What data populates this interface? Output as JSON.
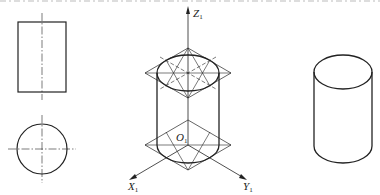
{
  "figure": {
    "top_caption_cutoff": "",
    "views": {
      "front_view": {
        "name": "front-view-rectangle"
      },
      "top_view": {
        "name": "top-view-circle"
      },
      "axonometric_construction": {
        "axes": {
          "z": {
            "letter": "Z",
            "sub": "1"
          },
          "x": {
            "letter": "X",
            "sub": "1"
          },
          "y": {
            "letter": "Y",
            "sub": "1"
          },
          "origin": {
            "letter": "O",
            "sub": "1"
          }
        }
      },
      "finished_cylinder": {
        "name": "isometric-cylinder"
      }
    },
    "colors": {
      "line": "#222222",
      "background": "#ffffff"
    }
  }
}
